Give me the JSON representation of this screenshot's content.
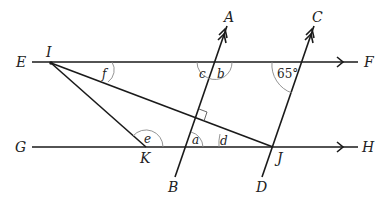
{
  "diagram": {
    "type": "geometry-parallel-lines",
    "points": {
      "E": "E",
      "F": "F",
      "G": "G",
      "H": "H",
      "A": "A",
      "B": "B",
      "C": "C",
      "D": "D",
      "I": "I",
      "J": "J",
      "K": "K"
    },
    "angles": {
      "a": "a",
      "b": "b",
      "c": "c",
      "d": "d",
      "e": "e",
      "f": "f",
      "given": "65°"
    },
    "lines": [
      {
        "name": "EF",
        "parallel_marker": "single-arrow"
      },
      {
        "name": "GH",
        "parallel_marker": "single-arrow"
      },
      {
        "name": "AB",
        "parallel_marker": "double-arrow"
      },
      {
        "name": "CD",
        "parallel_marker": "double-arrow"
      },
      {
        "name": "IK"
      },
      {
        "name": "IJ",
        "note": "perpendicular to AB"
      }
    ]
  }
}
